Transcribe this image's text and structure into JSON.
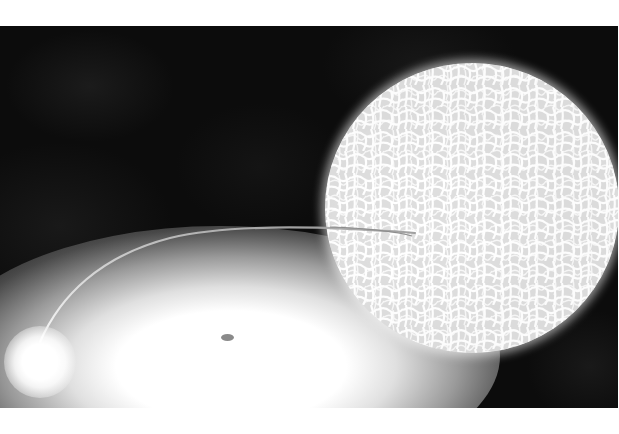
{
  "image": {
    "alt": "Artist illustration of a binary star system: a large textured giant star transferring a thin stream of material to a compact companion surrounded by a glowing accretion disk",
    "subjects": [
      {
        "name": "giant-star",
        "description": "large white star with cellular surface texture",
        "color": "#f0f0f0"
      },
      {
        "name": "mass-transfer-stream",
        "description": "thin curved filament from giant star to companion",
        "color": "#bfbfbf"
      },
      {
        "name": "accretion-disk",
        "description": "elliptical white glowing disk with small dark center",
        "color": "#ffffff"
      },
      {
        "name": "companion-star",
        "description": "small bright white star at lower left",
        "color": "#ffffff"
      }
    ],
    "background_color": "#0c0c0c",
    "border_color": "#ffffff"
  }
}
